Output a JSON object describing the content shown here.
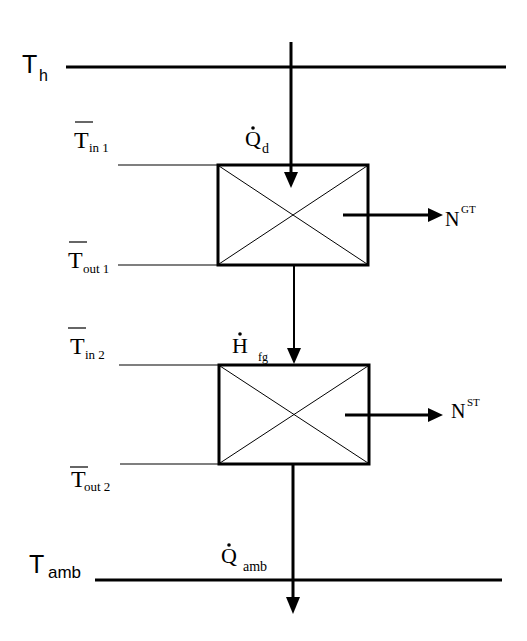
{
  "diagram": {
    "levels": {
      "hot": {
        "symbol": "T",
        "subscript": "h"
      },
      "ambient": {
        "symbol": "T",
        "subscript": "amb"
      }
    },
    "flows": {
      "heat_in": {
        "symbol": "Q",
        "subscript": "d",
        "dot": true
      },
      "flue_gas": {
        "symbol": "H",
        "subscript": "fg",
        "dot": true
      },
      "heat_out": {
        "symbol": "Q",
        "subscript": "amb",
        "dot": true
      }
    },
    "turbines": [
      {
        "name": "gas-turbine",
        "work": {
          "symbol": "N",
          "superscript": "GT"
        },
        "inlet": {
          "symbol": "T",
          "subscript": "in 1",
          "overbar": true
        },
        "outlet": {
          "symbol": "T",
          "subscript": "out 1",
          "overbar": true
        }
      },
      {
        "name": "steam-turbine",
        "work": {
          "symbol": "N",
          "superscript": "ST"
        },
        "inlet": {
          "symbol": "T",
          "subscript": "in 2",
          "overbar": true
        },
        "outlet": {
          "symbol": "T",
          "subscript": "out 2",
          "overbar": true
        }
      }
    ]
  }
}
